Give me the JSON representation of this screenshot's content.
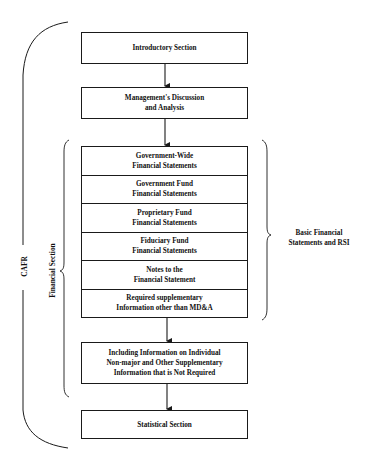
{
  "diagram": {
    "boxes": {
      "introductory": "Introductory Section",
      "mdna": {
        "line1": "Management's Discussion",
        "line2": "and Analysis"
      },
      "financial_rows": [
        {
          "line1": "Government-Wide",
          "line2": "Financial Statements"
        },
        {
          "line1": "Government Fund",
          "line2": "Financial Statements"
        },
        {
          "line1": "Proprietary Fund",
          "line2": "Financial Statements"
        },
        {
          "line1": "Fiduciary Fund",
          "line2": "Financial Statements"
        },
        {
          "line1": "Notes to the",
          "line2": "Financial Statement"
        },
        {
          "line1": "Required supplementary",
          "line2": "Information other than MD&A"
        }
      ],
      "supplementary": {
        "line1": "Including Information on Individual",
        "line2": "Non-major and Other Supplementary",
        "line3": "Information that is Not Required"
      },
      "statistical": "Statistical Section"
    },
    "labels": {
      "cafr": "CAFR",
      "financial_section": "Financial Section",
      "basic_rsi": {
        "line1": "Basic Financial",
        "line2": "Statements and RSI"
      }
    },
    "colors": {
      "line": "#1a1a1a",
      "background": "#ffffff"
    }
  }
}
